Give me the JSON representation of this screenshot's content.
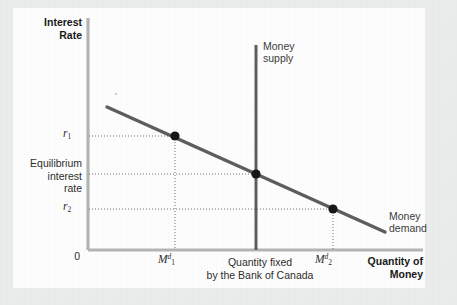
{
  "figure": {
    "background_color": "#eceded",
    "plot_background_color": "#ffffff",
    "axis_color": "#b3b5b5",
    "curve_color": "#5c5c5c",
    "point_color": "#1a1a1a",
    "leader_color": "#7a7a7a"
  },
  "axes": {
    "y_label": "Interest\nRate",
    "x_label": "Quantity of\nMoney",
    "origin_label": "0"
  },
  "annotations": {
    "money_supply": "Money\nsupply",
    "money_demand": "Money\ndemand",
    "equilibrium_rate": "Equilibrium\ninterest\nrate",
    "quantity_fixed_note": "Quantity fixed\nby the Bank of Canada"
  },
  "ticks": {
    "y": [
      {
        "id": "r1",
        "base": "r",
        "sub": "1",
        "sup": ""
      },
      {
        "id": "r2",
        "base": "r",
        "sub": "2",
        "sup": ""
      }
    ],
    "x": [
      {
        "id": "m1",
        "base": "M",
        "sub": "1",
        "sup": "d"
      },
      {
        "id": "m2",
        "base": "M",
        "sub": "2",
        "sup": "d"
      }
    ]
  },
  "chart_data": {
    "type": "line",
    "xlabel": "Quantity of Money",
    "ylabel": "Interest Rate",
    "grid": false,
    "legend": "inline-annotations",
    "xlim": [
      0,
      1
    ],
    "ylim": [
      0,
      1
    ],
    "axis_tick_labels": {
      "x": [
        "M_1^d",
        "M_2^d"
      ],
      "y": [
        "r_1",
        "Equilibrium interest rate",
        "r_2"
      ]
    },
    "series": [
      {
        "name": "Money demand",
        "type": "line",
        "style": "solid",
        "color": "#5c5c5c",
        "description": "Downward-sloping money demand curve",
        "points_px": [
          [
            107,
            107
          ],
          [
            385,
            232
          ]
        ],
        "x": [
          0.068,
          0.825
        ],
        "y": [
          0.615,
          0.078
        ]
      },
      {
        "name": "Money supply",
        "type": "vline",
        "style": "solid",
        "color": "#5c5c5c",
        "description": "Vertical money supply fixed by the Bank of Canada",
        "x_value": 0.498,
        "points_px": [
          [
            256,
            45
          ],
          [
            256,
            250
          ]
        ]
      }
    ],
    "markers": [
      {
        "name": "point-r1-m1",
        "x_label": "M_1^d",
        "y_label": "r_1",
        "x": 0.295,
        "y": 0.491,
        "px": [
          175,
          136
        ]
      },
      {
        "name": "point-equilibrium",
        "x_label": "Quantity fixed by the Bank of Canada",
        "y_label": "Equilibrium interest rate",
        "x": 0.498,
        "y": 0.327,
        "px": [
          256,
          174
        ]
      },
      {
        "name": "point-r2-m2",
        "x_label": "M_2^d",
        "y_label": "r_2",
        "x": 0.727,
        "y": 0.177,
        "px": [
          333,
          209
        ]
      }
    ],
    "leader_lines": [
      {
        "from": "y-axis at r_1",
        "to": "point-r1-m1",
        "then": "down to x-axis at M_1^d",
        "style": "dotted"
      },
      {
        "from": "y-axis at equilibrium rate",
        "to": "point-equilibrium",
        "style": "dotted"
      },
      {
        "from": "y-axis at r_2",
        "to": "point-r2-m2",
        "then": "down to x-axis at M_2^d",
        "style": "dotted"
      }
    ]
  }
}
